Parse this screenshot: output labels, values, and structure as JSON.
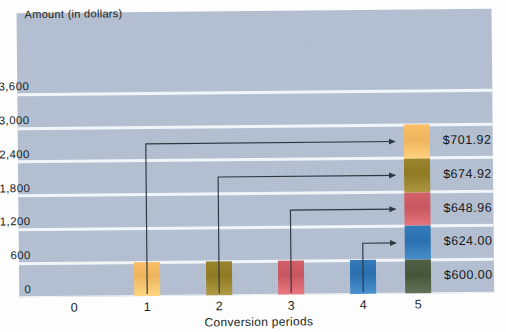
{
  "chart_data": {
    "type": "bar",
    "title": "",
    "ylabel": "Amount (in dollars)",
    "xlabel": "Conversion periods",
    "categories": [
      "0",
      "1",
      "2",
      "3",
      "4",
      "5"
    ],
    "x": [
      1,
      2,
      3,
      4,
      5
    ],
    "yticks": [
      "0",
      "600",
      "1,200",
      "1,800",
      "2,400",
      "3,000",
      "3,600"
    ],
    "ytick_values": [
      0,
      600,
      1200,
      1800,
      2400,
      3000,
      3600
    ],
    "ylim": [
      0,
      3600
    ],
    "grid": true,
    "legend": "none",
    "bars": [
      {
        "period": "1",
        "value": 600.0,
        "label": "$600.00",
        "color": "#e8a councils"
      },
      {
        "period": "2",
        "value": 624.0,
        "label": "$624.00",
        "color": "#8f7a23"
      },
      {
        "period": "3",
        "value": 648.96,
        "label": "$648.96",
        "color": "#c8565e"
      },
      {
        "period": "4",
        "value": 674.92,
        "label": "$674.92",
        "color": "#2a6fae"
      },
      {
        "period": "5",
        "value": 701.92,
        "label": "$701.92",
        "color": "#46553a"
      }
    ],
    "stack": {
      "period": "5",
      "total": 3249.8,
      "segments": [
        {
          "order": 1,
          "label": "$600.00",
          "value": 600.0,
          "color": "#46553a",
          "name": "period-1-contribution"
        },
        {
          "order": 2,
          "label": "$624.00",
          "value": 624.0,
          "color": "#2a6fae",
          "name": "period-2-contribution"
        },
        {
          "order": 3,
          "label": "$648.96",
          "value": 648.96,
          "color": "#c8565e",
          "name": "period-3-contribution"
        },
        {
          "order": 4,
          "label": "$674.92",
          "value": 674.92,
          "color": "#8f7a23",
          "name": "period-4-contribution"
        },
        {
          "order": 5,
          "label": "$701.92",
          "value": 701.92,
          "color": "#eeb45e",
          "name": "period-5-contribution"
        }
      ]
    },
    "value_labels": [
      "$701.92",
      "$674.92",
      "$648.96",
      "$624.00",
      "$600.00"
    ],
    "annotations": [
      {
        "from_period": "1",
        "to_segment": "$701.92"
      },
      {
        "from_period": "2",
        "to_segment": "$674.92"
      },
      {
        "from_period": "3",
        "to_segment": "$648.96"
      },
      {
        "from_period": "4",
        "to_segment": "$624.00"
      }
    ]
  },
  "colors": {
    "plot_background": "#b4c1d2",
    "gridline": "#f2f5f8",
    "text": "#1a1f27",
    "arrow": "#2e3742",
    "bar_orange": "#eeb45e",
    "bar_olive": "#8f7a23",
    "bar_red": "#c8565e",
    "bar_blue": "#2a6fae",
    "bar_green": "#46553a"
  }
}
